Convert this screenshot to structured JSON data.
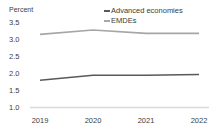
{
  "chart_data": {
    "type": "line",
    "title": "",
    "subtitle": "",
    "xlabel": "",
    "ylabel": "Percent",
    "ylim": [
      1.0,
      3.5
    ],
    "xlim": [
      "2019",
      "2022"
    ],
    "grid": false,
    "legend_position": "top-right",
    "categories": [
      "2019",
      "2020",
      "2021",
      "2022"
    ],
    "ytick_labels": [
      "3.5",
      "3.0",
      "2.5",
      "2.0",
      "1.5",
      "1.0"
    ],
    "ytick_values": [
      3.5,
      3.0,
      2.5,
      2.0,
      1.5,
      1.0
    ],
    "series": [
      {
        "name": "Advanced economies",
        "color": "#595959",
        "values": [
          1.8,
          1.95,
          1.95,
          1.97
        ]
      },
      {
        "name": "EMDEs",
        "color": "#a6a6a6",
        "values": [
          3.15,
          3.28,
          3.18,
          3.18
        ]
      }
    ],
    "axis_line_color": "#d9d9d9"
  },
  "legend": {
    "items": [
      {
        "label": "Advanced economies",
        "color": "#595959"
      },
      {
        "label": "EMDEs",
        "color": "#a6a6a6"
      }
    ]
  }
}
